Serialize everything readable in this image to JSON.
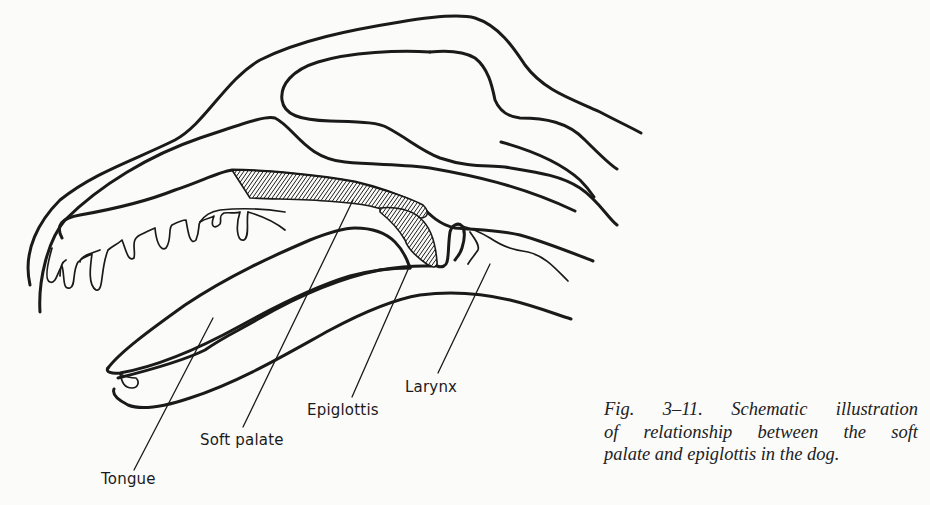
{
  "figure": {
    "title": "Fig. 3–11. Schematic illustration of relationship between the soft palate and epiglottis in the dog.",
    "labels": {
      "tongue": "Tongue",
      "soft_palate": "Soft palate",
      "epiglottis": "Epiglottis",
      "larynx": "Larynx"
    },
    "caption": {
      "line1": "Fig. 3–11. Schematic illustration",
      "line2": "of relationship between the soft",
      "line3": "palate and epiglottis in the dog."
    },
    "colors": {
      "ink": "#1a1a1a",
      "paper": "#fbfbfa"
    }
  }
}
